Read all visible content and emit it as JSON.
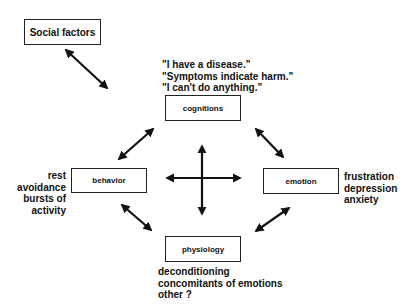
{
  "diagram": {
    "nodes": {
      "social": {
        "label": "Social factors"
      },
      "cognitions": {
        "label": "cognitions"
      },
      "behavior": {
        "label": "behavior"
      },
      "emotion": {
        "label": "emotion"
      },
      "physiology": {
        "label": "physiology"
      }
    },
    "annotations": {
      "cognitions": [
        "\"I have a disease.\"",
        "\"Symptoms indicate harm.\"",
        "\"I can't do anything.\""
      ],
      "behavior": [
        "rest",
        "avoidance",
        "bursts of",
        "activity"
      ],
      "emotion": [
        "frustration",
        "depression",
        "anxiety"
      ],
      "physiology": [
        "deconditioning",
        "concomitants of emotions",
        "other ?"
      ]
    },
    "edges": [
      {
        "from": "social",
        "to": "cognitions",
        "type": "bidirectional"
      },
      {
        "from": "cognitions",
        "to": "behavior",
        "type": "bidirectional"
      },
      {
        "from": "cognitions",
        "to": "emotion",
        "type": "bidirectional"
      },
      {
        "from": "behavior",
        "to": "physiology",
        "type": "bidirectional"
      },
      {
        "from": "emotion",
        "to": "physiology",
        "type": "bidirectional"
      },
      {
        "from": "center",
        "to": "all",
        "type": "four-way-cross"
      }
    ],
    "colors": {
      "line": "#111111",
      "box_border": "#222222",
      "background": "#ffffff"
    }
  }
}
